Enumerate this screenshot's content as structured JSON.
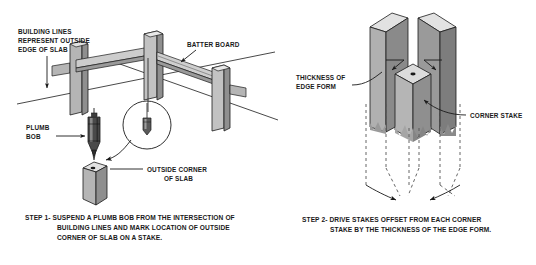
{
  "figure": {
    "background_color": "#ffffff",
    "ink_color": "#1a1a1a"
  },
  "palette": {
    "face_light": "#e2e2e2",
    "face_mid": "#b5b5b5",
    "face_dark": "#8f8f8f",
    "face_darker": "#6e6e6e",
    "plumb_body": "#4a4a4a",
    "plumb_highlight": "#8a8a8a",
    "line": "#1a1a1a",
    "dashed": "#555555"
  },
  "left_panel": {
    "name": "step-1-batter-board-diagram",
    "labels": {
      "building_lines": {
        "line1": "BUILDING LINES",
        "line2": "REPRESENT OUTSIDE",
        "line3": "EDGE OF SLAB"
      },
      "batter_board": "BATTER BOARD",
      "plumb_bob": {
        "line1": "PLUMB",
        "line2": "BOB"
      },
      "outside_corner": {
        "line1": "OUTSIDE CORNER",
        "line2": "OF SLAB"
      }
    },
    "caption": {
      "line1": "STEP 1- SUSPEND A PLUMB BOB FROM THE INTERSECTION OF",
      "line2": "BUILDING LINES AND MARK LOCATION OF OUTSIDE",
      "line3": "CORNER OF SLAB ON A STAKE."
    }
  },
  "right_panel": {
    "name": "step-2-corner-stake-diagram",
    "labels": {
      "thickness_of_edge_form": {
        "line1": "THICKNESS OF",
        "line2": "EDGE FORM"
      },
      "corner_stake": "CORNER STAKE"
    },
    "caption": {
      "line1": "STEP 2- DRIVE STAKES OFFSET FROM EACH CORNER",
      "line2": "STAKE BY THE THICKNESS OF THE EDGE FORM."
    }
  }
}
